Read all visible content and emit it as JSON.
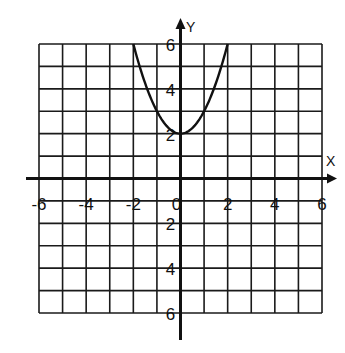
{
  "chart_data": {
    "type": "line",
    "title": "",
    "xlabel": "X",
    "ylabel": "Y",
    "xlim": [
      -6,
      6
    ],
    "ylim": [
      -6,
      6
    ],
    "grid": true,
    "grid_step": 1,
    "x_ticks": [
      -6,
      -4,
      -2,
      0,
      2,
      4,
      6
    ],
    "y_ticks": [
      6,
      4,
      2,
      -2,
      -4,
      -6
    ],
    "x_tick_labels": [
      "-6",
      "-4",
      "-2",
      "0",
      "2",
      "4",
      "6"
    ],
    "y_tick_labels_positive": [
      "6",
      "4",
      "2"
    ],
    "y_tick_labels_negative": [
      "2",
      "4",
      "6"
    ],
    "origin_label": "0",
    "series": [
      {
        "name": "y = x^2 + 2",
        "x": [
          -2,
          -1.5,
          -1,
          -0.5,
          0,
          0.5,
          1,
          1.5,
          2
        ],
        "y": [
          6,
          4.25,
          3,
          2.25,
          2,
          2.25,
          3,
          4.25,
          6
        ]
      }
    ],
    "colors": {
      "line": "#111111",
      "grid": "#1a1a1a",
      "background": "#ffffff"
    }
  }
}
